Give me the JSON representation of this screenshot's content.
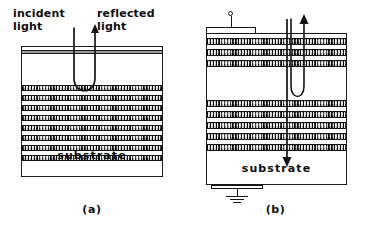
{
  "figure": {
    "type": "schematic-diagram",
    "background_color": "#ffffff",
    "ink_color": "#141414",
    "layer_fill_color": "#8d8d8d"
  },
  "panel_a": {
    "caption": "(a)",
    "annotations": {
      "incident": "incident\nlight",
      "reflected": "reflected\nlight"
    },
    "substrate_label": "substrate",
    "layer_count": 8,
    "rays": [
      {
        "name": "incident-ray",
        "direction": "down-into-stack"
      },
      {
        "name": "reflected-ray",
        "direction": "up-out-of-stack",
        "arrowhead": true
      }
    ]
  },
  "panel_b": {
    "caption": "(b)",
    "substrate_label": "substrate",
    "top_contact": "electrode-with-lead",
    "bottom_contact": "ground-symbol",
    "layer_count_upper": 3,
    "layer_count_lower": 5,
    "cavity": "undoped-spacer-region",
    "rays": [
      {
        "name": "current-path-line",
        "direction": "vertical-through-stack"
      },
      {
        "name": "emitted-light-arrow",
        "direction": "up",
        "arrowhead": true
      },
      {
        "name": "carrier-arrow",
        "direction": "down-into-substrate",
        "arrowhead": true
      }
    ]
  }
}
